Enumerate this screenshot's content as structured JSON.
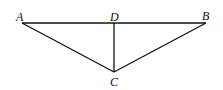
{
  "diagram": {
    "type": "geometry",
    "stroke_color": "#111111",
    "points": {
      "A": {
        "label": "A",
        "x": 22,
        "y": 23
      },
      "B": {
        "label": "B",
        "x": 206,
        "y": 23
      },
      "C": {
        "label": "C",
        "x": 114,
        "y": 72
      },
      "D": {
        "label": "D",
        "x": 114,
        "y": 23
      }
    },
    "segments": [
      {
        "from": "A",
        "to": "B"
      },
      {
        "from": "A",
        "to": "C"
      },
      {
        "from": "B",
        "to": "C"
      },
      {
        "from": "D",
        "to": "C"
      }
    ]
  }
}
